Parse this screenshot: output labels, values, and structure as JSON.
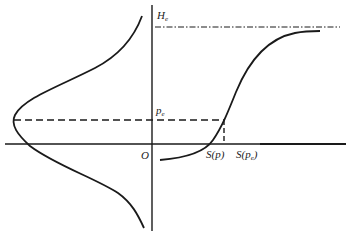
{
  "diagram": {
    "labels": {
      "He_main": "H",
      "He_sub": "e",
      "pe_main": "p",
      "pe_sub": "e",
      "origin": "O",
      "Sp": "S(p)",
      "Spe_main": "S(p",
      "Spe_sub": "e",
      "Spe_close": ")"
    },
    "elements": {
      "vertical_axis": "vertical axis",
      "horizontal_axis": "horizontal axis",
      "bell_curve": "normal distribution curve",
      "s_curve": "S-shaped curve",
      "He_line": "dash-dot asymptote line at H_e",
      "pe_line": "dashed line at p_e"
    },
    "colors": {
      "ink": "#1a1a1a",
      "background": "#ffffff"
    }
  }
}
